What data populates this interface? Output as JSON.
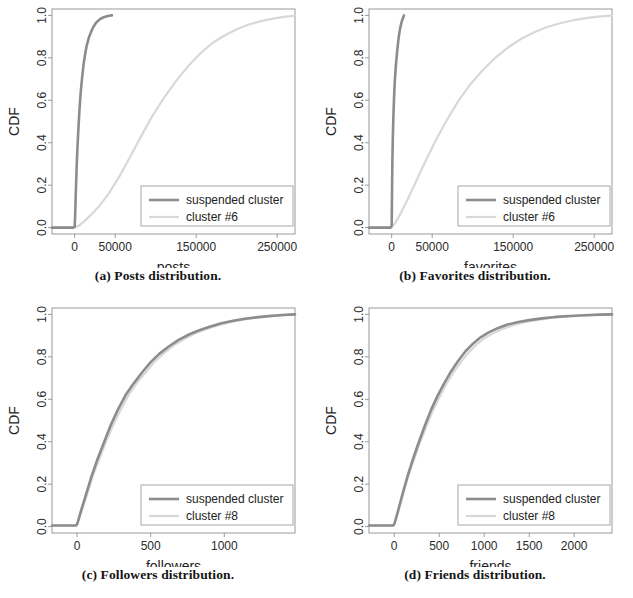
{
  "figure": {
    "background": "#ffffff",
    "rows": 2,
    "cols": 2
  },
  "colors": {
    "suspended_cluster": "#8c8c8c",
    "other_cluster": "#d8d8d8",
    "axis": "#9a9a9a",
    "text": "#222222"
  },
  "chart_data": [
    {
      "type": "line",
      "id": "posts",
      "caption": "(a) Posts distribution.",
      "title": "",
      "xlabel": "posts",
      "ylabel": "CDF",
      "xlim": [
        -28000,
        272000
      ],
      "ylim": [
        -0.03,
        1.03
      ],
      "xticks": [
        0,
        50000,
        150000,
        250000
      ],
      "xticklabels": [
        "0",
        "50000",
        "150000",
        "250000"
      ],
      "yticks": [
        0.0,
        0.2,
        0.4,
        0.6,
        0.8,
        1.0
      ],
      "yticklabels": [
        "0.0",
        "0.2",
        "0.4",
        "0.6",
        "0.8",
        "1.0"
      ],
      "grid": false,
      "legend_position": "lower right",
      "series": [
        {
          "name": "suspended cluster",
          "color": "#8c8c8c",
          "width": 2.6,
          "x": [
            -28000,
            -2000,
            0,
            500,
            1200,
            2200,
            3200,
            4500,
            6000,
            7500,
            9000,
            11000,
            13000,
            15000,
            17500,
            20000,
            23000,
            26000,
            29000,
            32000,
            35000,
            38000,
            41000,
            44000,
            46000
          ],
          "y": [
            0.0,
            0.0,
            0.005,
            0.05,
            0.14,
            0.26,
            0.36,
            0.46,
            0.56,
            0.64,
            0.7,
            0.77,
            0.82,
            0.86,
            0.895,
            0.92,
            0.945,
            0.963,
            0.975,
            0.984,
            0.99,
            0.994,
            0.997,
            0.999,
            1.0
          ]
        },
        {
          "name": "cluster #6",
          "color": "#d8d8d8",
          "width": 2.2,
          "x": [
            -28000,
            0,
            5000,
            12000,
            20000,
            30000,
            42000,
            55000,
            68000,
            82000,
            95000,
            110000,
            125000,
            140000,
            155000,
            170000,
            185000,
            200000,
            215000,
            230000,
            245000,
            258000,
            272000
          ],
          "y": [
            0.0,
            0.0,
            0.01,
            0.03,
            0.06,
            0.1,
            0.16,
            0.24,
            0.33,
            0.43,
            0.52,
            0.61,
            0.69,
            0.76,
            0.82,
            0.87,
            0.905,
            0.935,
            0.957,
            0.973,
            0.985,
            0.993,
            0.999
          ]
        }
      ]
    },
    {
      "type": "line",
      "id": "favorites",
      "caption": "(b) Favorites distribution.",
      "title": "",
      "xlabel": "favorites",
      "ylabel": "CDF",
      "xlim": [
        -28000,
        272000
      ],
      "ylim": [
        -0.03,
        1.03
      ],
      "xticks": [
        0,
        50000,
        150000,
        250000
      ],
      "xticklabels": [
        "0",
        "50000",
        "150000",
        "250000"
      ],
      "yticks": [
        0.0,
        0.2,
        0.4,
        0.6,
        0.8,
        1.0
      ],
      "yticklabels": [
        "0.0",
        "0.2",
        "0.4",
        "0.6",
        "0.8",
        "1.0"
      ],
      "grid": false,
      "legend_position": "lower right",
      "series": [
        {
          "name": "suspended cluster",
          "color": "#8c8c8c",
          "width": 2.6,
          "x": [
            -28000,
            -1500,
            0,
            200,
            500,
            900,
            1400,
            2000,
            2700,
            3400,
            4200,
            5000,
            6000,
            7000,
            8000,
            9200,
            10500,
            11800,
            13000,
            14200,
            15200
          ],
          "y": [
            0.0,
            0.0,
            0.01,
            0.08,
            0.2,
            0.32,
            0.42,
            0.51,
            0.59,
            0.655,
            0.71,
            0.755,
            0.8,
            0.84,
            0.875,
            0.91,
            0.94,
            0.962,
            0.978,
            0.99,
            1.0
          ]
        },
        {
          "name": "cluster #6",
          "color": "#d8d8d8",
          "width": 2.2,
          "x": [
            -28000,
            0,
            4000,
            10000,
            18000,
            28000,
            40000,
            53000,
            67000,
            82000,
            96000,
            112000,
            128000,
            144000,
            160000,
            176000,
            192000,
            208000,
            225000,
            242000,
            258000,
            272000
          ],
          "y": [
            0.0,
            0.0,
            0.02,
            0.06,
            0.12,
            0.2,
            0.3,
            0.4,
            0.5,
            0.595,
            0.67,
            0.74,
            0.8,
            0.85,
            0.89,
            0.92,
            0.945,
            0.963,
            0.978,
            0.988,
            0.995,
            0.999
          ]
        }
      ]
    },
    {
      "type": "line",
      "id": "followers",
      "caption": "(c) Followers distribution.",
      "title": "",
      "xlabel": "followers",
      "ylabel": "CDF",
      "xlim": [
        -170,
        1480
      ],
      "ylim": [
        -0.03,
        1.03
      ],
      "xticks": [
        0,
        500,
        1000
      ],
      "xticklabels": [
        "0",
        "500",
        "1000"
      ],
      "yticks": [
        0.0,
        0.2,
        0.4,
        0.6,
        0.8,
        1.0
      ],
      "yticklabels": [
        "0.0",
        "0.2",
        "0.4",
        "0.6",
        "0.8",
        "1.0"
      ],
      "grid": false,
      "legend_position": "lower right",
      "series": [
        {
          "name": "suspended cluster",
          "color": "#8c8c8c",
          "width": 2.6,
          "x": [
            -170,
            -10,
            0,
            25,
            60,
            100,
            140,
            185,
            230,
            280,
            330,
            385,
            440,
            500,
            560,
            625,
            690,
            760,
            830,
            900,
            980,
            1060,
            1140,
            1230,
            1320,
            1400,
            1480
          ],
          "y": [
            0.005,
            0.005,
            0.01,
            0.07,
            0.15,
            0.24,
            0.32,
            0.4,
            0.48,
            0.555,
            0.62,
            0.675,
            0.725,
            0.775,
            0.815,
            0.85,
            0.88,
            0.905,
            0.925,
            0.942,
            0.958,
            0.97,
            0.979,
            0.987,
            0.993,
            0.997,
            1.0
          ]
        },
        {
          "name": "cluster #8",
          "color": "#d8d8d8",
          "width": 2.2,
          "x": [
            -170,
            -10,
            0,
            30,
            70,
            110,
            155,
            200,
            250,
            300,
            355,
            410,
            470,
            530,
            595,
            660,
            730,
            800,
            875,
            950,
            1030,
            1110,
            1200,
            1290,
            1380,
            1480
          ],
          "y": [
            0.005,
            0.005,
            0.01,
            0.07,
            0.155,
            0.245,
            0.325,
            0.405,
            0.485,
            0.555,
            0.625,
            0.68,
            0.73,
            0.78,
            0.82,
            0.855,
            0.885,
            0.91,
            0.93,
            0.947,
            0.962,
            0.973,
            0.983,
            0.99,
            0.996,
            1.0
          ]
        }
      ]
    },
    {
      "type": "line",
      "id": "friends",
      "caption": "(d) Friends distribution.",
      "title": "",
      "xlabel": "friends",
      "ylabel": "CDF",
      "xlim": [
        -280,
        2420
      ],
      "ylim": [
        -0.03,
        1.03
      ],
      "xticks": [
        0,
        500,
        1000,
        1500,
        2000
      ],
      "xticklabels": [
        "0",
        "500",
        "1000",
        "1500",
        "2000"
      ],
      "yticks": [
        0.0,
        0.2,
        0.4,
        0.6,
        0.8,
        1.0
      ],
      "yticklabels": [
        "0.0",
        "0.2",
        "0.4",
        "0.6",
        "0.8",
        "1.0"
      ],
      "grid": false,
      "legend_position": "lower right",
      "series": [
        {
          "name": "suspended cluster",
          "color": "#8c8c8c",
          "width": 2.6,
          "x": [
            -280,
            -15,
            0,
            40,
            90,
            150,
            210,
            275,
            340,
            410,
            480,
            555,
            630,
            710,
            790,
            875,
            960,
            1050,
            1150,
            1260,
            1380,
            1500,
            1640,
            1790,
            1950,
            2120,
            2280,
            2420
          ],
          "y": [
            0.005,
            0.005,
            0.01,
            0.07,
            0.15,
            0.24,
            0.32,
            0.4,
            0.475,
            0.55,
            0.615,
            0.675,
            0.73,
            0.78,
            0.825,
            0.862,
            0.892,
            0.915,
            0.935,
            0.952,
            0.964,
            0.973,
            0.981,
            0.988,
            0.992,
            0.996,
            0.999,
            1.0
          ]
        },
        {
          "name": "cluster #8",
          "color": "#d8d8d8",
          "width": 2.2,
          "x": [
            -280,
            -15,
            0,
            45,
            100,
            160,
            225,
            290,
            360,
            430,
            505,
            580,
            660,
            745,
            830,
            920,
            1010,
            1110,
            1215,
            1330,
            1450,
            1580,
            1720,
            1870,
            2030,
            2200,
            2420
          ],
          "y": [
            0.005,
            0.005,
            0.01,
            0.07,
            0.152,
            0.242,
            0.322,
            0.4,
            0.475,
            0.548,
            0.612,
            0.672,
            0.728,
            0.778,
            0.822,
            0.86,
            0.89,
            0.913,
            0.933,
            0.95,
            0.963,
            0.973,
            0.982,
            0.988,
            0.993,
            0.997,
            1.0
          ]
        }
      ]
    }
  ]
}
